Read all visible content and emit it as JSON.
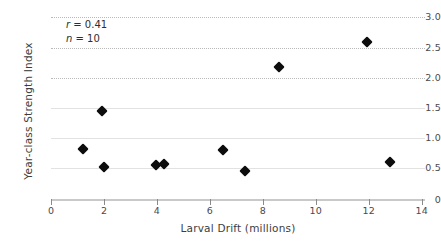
{
  "chart_data": {
    "type": "scatter",
    "title": "",
    "xlabel": "Larval Drift (millions)",
    "ylabel": "Year-class Strength Index",
    "xlim": [
      0,
      14
    ],
    "ylim": [
      0,
      3.0
    ],
    "grid": true,
    "legend": null,
    "marker": "filled-diamond",
    "marker_color": "#0d0d0d",
    "x_ticks": [
      0,
      2,
      4,
      6,
      8,
      10,
      12,
      14
    ],
    "x_tick_labels": [
      "0",
      "2",
      "4",
      "6",
      "8",
      "10",
      "12",
      "14"
    ],
    "y_ticks": [
      0,
      0.5,
      1.0,
      1.5,
      2.0,
      2.5,
      3.0
    ],
    "y_tick_labels": [
      "0",
      "0.5",
      "1.0",
      "1.5",
      "2.0",
      "2.5",
      "3.0"
    ],
    "points": [
      {
        "x": 1.22,
        "y": 0.82
      },
      {
        "x": 1.91,
        "y": 1.45
      },
      {
        "x": 2.01,
        "y": 0.52
      },
      {
        "x": 3.96,
        "y": 0.55
      },
      {
        "x": 4.28,
        "y": 0.58
      },
      {
        "x": 6.48,
        "y": 0.8
      },
      {
        "x": 7.33,
        "y": 0.45
      },
      {
        "x": 8.62,
        "y": 2.18
      },
      {
        "x": 11.92,
        "y": 2.6
      },
      {
        "x": 12.8,
        "y": 0.6
      }
    ],
    "annotations": [
      {
        "label": "r",
        "equals": " = 0.41",
        "text": "r = 0.41"
      },
      {
        "label": "n",
        "equals": " = 10",
        "text": "n = 10"
      }
    ]
  },
  "style": {
    "background": "#ffffff",
    "gridline_color": "#b9b9b9",
    "axis_color": "#c9c9c9",
    "tick_text_color": "#4a4a4a",
    "title_text_color": "#3d3d3d"
  }
}
